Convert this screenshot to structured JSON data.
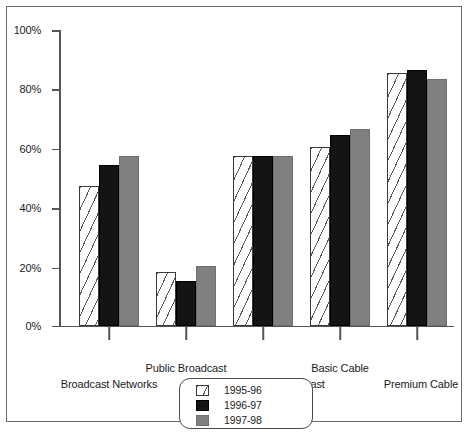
{
  "chart_data": {
    "type": "bar",
    "title": "",
    "xlabel": "",
    "ylabel": "",
    "ylim": [
      0,
      100
    ],
    "yticks": [
      0,
      20,
      40,
      60,
      80,
      100
    ],
    "ytick_labels": [
      "0%",
      "20%",
      "40%",
      "60%",
      "80%",
      "100%"
    ],
    "grid": false,
    "legend_position": "bottom-center",
    "categories": [
      "Broadcast Networks",
      "Public Broadcast",
      "Independent Broadcast",
      "Basic Cable",
      "Premium Cable"
    ],
    "series": [
      {
        "name": "1995-96",
        "color": "#ffffff",
        "values": [
          47,
          18,
          57,
          60,
          85
        ]
      },
      {
        "name": "1996-97",
        "color": "#141414",
        "values": [
          54,
          15,
          57,
          64,
          86
        ]
      },
      {
        "name": "1997-98",
        "color": "#808080",
        "values": [
          57,
          20,
          57,
          66,
          83
        ]
      }
    ]
  },
  "axis": {
    "y_labels": [
      "100%",
      "80%",
      "60%",
      "40%",
      "20%",
      "0%"
    ]
  },
  "categories_layout": [
    {
      "label": "Broadcast Networks",
      "row": "bot"
    },
    {
      "label": "Public Broadcast",
      "row": "top"
    },
    {
      "label": "Independent Broadcast",
      "row": "bot"
    },
    {
      "label": "Basic Cable",
      "row": "top"
    },
    {
      "label": "Premium Cable",
      "row": "bot"
    }
  ],
  "legend": {
    "items": [
      {
        "label": "1995-96"
      },
      {
        "label": "1996-97"
      },
      {
        "label": "1997-98"
      }
    ]
  }
}
